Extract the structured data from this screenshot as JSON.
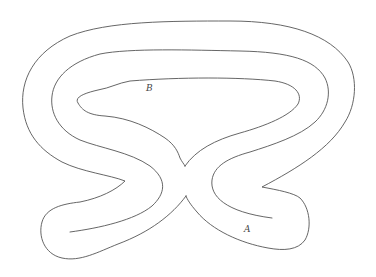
{
  "diagram": {
    "type": "region-boundary-figure",
    "background": "#ffffff",
    "stroke_color": "#555555",
    "labels": [
      {
        "id": "B",
        "text": "B",
        "x": 148,
        "y": 86
      },
      {
        "id": "A",
        "text": "A",
        "x": 245,
        "y": 227
      }
    ],
    "curves": [
      {
        "id": "outer-boundary",
        "closed": true
      },
      {
        "id": "inner-loop-b",
        "closed": true
      },
      {
        "id": "middle-path",
        "closed": false
      }
    ]
  }
}
